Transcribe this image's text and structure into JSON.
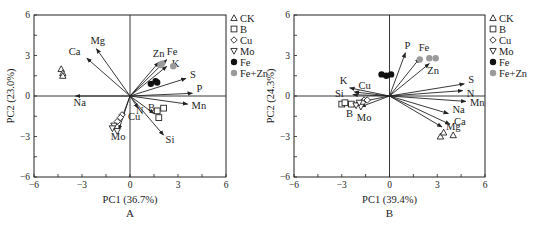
{
  "chart_data": [
    {
      "type": "scatter",
      "subtype": "pca-biplot",
      "panel_label": "A",
      "xlabel": "PC1 (36.7%)",
      "ylabel": "PC2 (23.0%)",
      "xlim": [
        -6,
        6
      ],
      "ylim": [
        -6,
        6
      ],
      "xticks": [
        -6,
        -3,
        0,
        3,
        6
      ],
      "yticks": [
        -6,
        -3,
        0,
        3,
        6
      ],
      "grid": false,
      "legend_position": "right",
      "legend": [
        {
          "label": "CK",
          "marker": "triangle-up-open"
        },
        {
          "label": "B",
          "marker": "square-open"
        },
        {
          "label": "Cu",
          "marker": "diamond-open"
        },
        {
          "label": "Mo",
          "marker": "triangle-down-open"
        },
        {
          "label": "Fe",
          "marker": "circle-filled-black"
        },
        {
          "label": "Fe+Zn",
          "marker": "circle-filled-gray"
        }
      ],
      "loadings": [
        {
          "label": "Na",
          "x": -3.4,
          "y": 0.0
        },
        {
          "label": "Ca",
          "x": -2.7,
          "y": 2.8
        },
        {
          "label": "Mg",
          "x": -2.1,
          "y": 3.5
        },
        {
          "label": "Zn",
          "x": 1.8,
          "y": 2.5
        },
        {
          "label": "Fe",
          "x": 2.3,
          "y": 2.7
        },
        {
          "label": "K",
          "x": 2.3,
          "y": 2.2
        },
        {
          "label": "S",
          "x": 3.5,
          "y": 1.3
        },
        {
          "label": "P",
          "x": 3.9,
          "y": 0.2
        },
        {
          "label": "Mn",
          "x": 3.6,
          "y": -0.6
        },
        {
          "label": "B",
          "x": 1.5,
          "y": -1.3
        },
        {
          "label": "N",
          "x": 0.5,
          "y": -0.9
        },
        {
          "label": "Si",
          "x": 2.1,
          "y": -2.9
        },
        {
          "label": "Cu",
          "x": -0.5,
          "y": -1.6
        },
        {
          "label": "Mo",
          "x": -0.7,
          "y": -2.5
        }
      ],
      "series": [
        {
          "name": "CK",
          "points": [
            [
              -4.3,
              2.0
            ],
            [
              -4.2,
              1.7
            ],
            [
              -4.2,
              1.5
            ]
          ]
        },
        {
          "name": "B",
          "points": [
            [
              1.7,
              -1.1
            ],
            [
              2.1,
              -0.9
            ],
            [
              1.8,
              -1.6
            ]
          ]
        },
        {
          "name": "Cu",
          "points": [
            [
              -0.5,
              -1.4
            ],
            [
              -0.6,
              -1.6
            ],
            [
              -0.8,
              -1.9
            ]
          ]
        },
        {
          "name": "Mo",
          "points": [
            [
              -1.0,
              -2.2
            ],
            [
              -1.1,
              -2.4
            ],
            [
              -0.8,
              -2.6
            ]
          ]
        },
        {
          "name": "Fe",
          "points": [
            [
              1.3,
              0.9
            ],
            [
              1.7,
              1.0
            ],
            [
              1.6,
              1.1
            ]
          ]
        },
        {
          "name": "Fe+Zn",
          "points": [
            [
              1.9,
              2.3
            ],
            [
              2.7,
              2.2
            ],
            [
              2.0,
              2.4
            ]
          ]
        }
      ]
    },
    {
      "type": "scatter",
      "subtype": "pca-biplot",
      "panel_label": "B",
      "xlabel": "PC1 (39.4%)",
      "ylabel": "PC2 (24.3%)",
      "xlim": [
        -6,
        6
      ],
      "ylim": [
        -6,
        6
      ],
      "xticks": [
        -6,
        -3,
        0,
        3,
        6
      ],
      "yticks": [
        -6,
        -3,
        0,
        3,
        6
      ],
      "grid": false,
      "legend_position": "right",
      "legend": [
        {
          "label": "CK",
          "marker": "triangle-up-open"
        },
        {
          "label": "B",
          "marker": "square-open"
        },
        {
          "label": "Cu",
          "marker": "diamond-open"
        },
        {
          "label": "Mo",
          "marker": "triangle-down-open"
        },
        {
          "label": "Fe",
          "marker": "circle-filled-black"
        },
        {
          "label": "Fe+Zn",
          "marker": "circle-filled-gray"
        }
      ],
      "loadings": [
        {
          "label": "P",
          "x": 1.0,
          "y": 3.2
        },
        {
          "label": "Fe",
          "x": 1.9,
          "y": 2.8
        },
        {
          "label": "Zn",
          "x": 2.5,
          "y": 2.4
        },
        {
          "label": "S",
          "x": 4.7,
          "y": 0.9
        },
        {
          "label": "N",
          "x": 4.6,
          "y": 0.4
        },
        {
          "label": "Mn",
          "x": 4.8,
          "y": -0.4
        },
        {
          "label": "Na",
          "x": 3.7,
          "y": -1.3
        },
        {
          "label": "Ca",
          "x": 3.8,
          "y": -2.1
        },
        {
          "label": "Mg",
          "x": 3.3,
          "y": -2.3
        },
        {
          "label": "K",
          "x": -2.5,
          "y": 0.6
        },
        {
          "label": "Cu",
          "x": -2.2,
          "y": 0.3
        },
        {
          "label": "Si",
          "x": -2.3,
          "y": 0.1
        },
        {
          "label": "B",
          "x": -2.1,
          "y": -0.5
        },
        {
          "label": "Mo",
          "x": -1.8,
          "y": -0.8
        }
      ],
      "series": [
        {
          "name": "CK",
          "points": [
            [
              3.2,
              -3.0
            ],
            [
              3.4,
              -2.7
            ],
            [
              4.0,
              -2.9
            ]
          ]
        },
        {
          "name": "B",
          "points": [
            [
              -3.0,
              -0.6
            ],
            [
              -2.8,
              -0.5
            ],
            [
              -2.4,
              -0.6
            ]
          ]
        },
        {
          "name": "Cu",
          "points": [
            [
              -1.6,
              -0.3
            ],
            [
              -1.7,
              -0.5
            ],
            [
              -1.4,
              -0.3
            ]
          ]
        },
        {
          "name": "Mo",
          "points": [
            [
              -1.8,
              -0.8
            ],
            [
              -2.1,
              -0.7
            ],
            [
              -1.9,
              -0.5
            ]
          ]
        },
        {
          "name": "Fe",
          "points": [
            [
              -0.5,
              1.6
            ],
            [
              -0.2,
              1.5
            ],
            [
              0.1,
              1.6
            ]
          ]
        },
        {
          "name": "Fe+Zn",
          "points": [
            [
              1.9,
              2.7
            ],
            [
              2.5,
              2.8
            ],
            [
              2.9,
              2.8
            ]
          ]
        }
      ]
    }
  ]
}
